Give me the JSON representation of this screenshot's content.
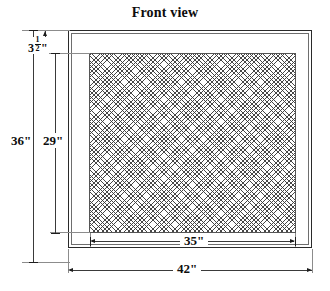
{
  "drawing": {
    "title": "Front view",
    "type": "mechanical-dimension-drawing",
    "subject": "rectangular grille / filter frame with mesh panel",
    "units": "inches"
  },
  "dimensions": {
    "overall_height": {
      "label": "36\"",
      "value": 36,
      "unit": "in",
      "orientation": "vertical",
      "position": "left-outer"
    },
    "panel_height": {
      "label": "29\"",
      "value": 29,
      "unit": "in",
      "orientation": "vertical",
      "position": "left-inner"
    },
    "frame_top": {
      "label": "3½\"",
      "whole": "3",
      "numerator": "1",
      "denominator": "2",
      "inch_mark": "\"",
      "value": 3.5,
      "unit": "in",
      "orientation": "vertical",
      "position": "left-top"
    },
    "panel_width": {
      "label": "35\"",
      "value": 35,
      "unit": "in",
      "orientation": "horizontal",
      "position": "bottom-inner"
    },
    "overall_width": {
      "label": "42\"",
      "value": 42,
      "unit": "in",
      "orientation": "horizontal",
      "position": "bottom-outer"
    }
  },
  "parts": {
    "outer_frame_name": "outer-frame",
    "mesh_panel_name": "mesh-panel",
    "mesh_pattern": "diagonal-crosshatch-diamond"
  },
  "colors": {
    "line": "#3a3a3a",
    "heavy_line": "#1d1d1d",
    "extension_line": "#8c8c8c",
    "mesh": "#282828",
    "background": "#ffffff",
    "text": "#0d0d0d"
  }
}
